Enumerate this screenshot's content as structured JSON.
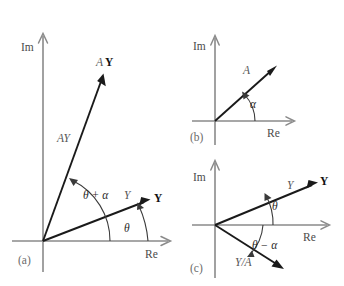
{
  "figure": {
    "background_color": "#ffffff",
    "axis_color": "#8a8a8a",
    "vector_color": "#1a1a1a",
    "arc_color": "#3a3a3a",
    "width": 344,
    "height": 286
  },
  "panels": [
    {
      "id": "a",
      "caption": "(a)",
      "axis_labels": {
        "imaginary": "Im",
        "real": "Re"
      },
      "vectors": [
        {
          "name": "AY-bold",
          "label": "AY",
          "style": "bold"
        },
        {
          "name": "AY-italic",
          "label": "AY",
          "style": "italic"
        },
        {
          "name": "Y-bold",
          "label": "Y",
          "style": "bold"
        },
        {
          "name": "Y-italic",
          "label": "Y",
          "style": "italic"
        }
      ],
      "angles": [
        {
          "name": "theta-plus-alpha",
          "label": "θ + α"
        },
        {
          "name": "theta",
          "label": "θ"
        }
      ]
    },
    {
      "id": "b",
      "caption": "(b)",
      "axis_labels": {
        "imaginary": "Im",
        "real": "Re"
      },
      "vectors": [
        {
          "name": "A-italic",
          "label": "A",
          "style": "italic"
        }
      ],
      "angles": [
        {
          "name": "alpha",
          "label": "α"
        }
      ]
    },
    {
      "id": "c",
      "caption": "(c)",
      "axis_labels": {
        "imaginary": "Im",
        "real": "Re"
      },
      "vectors": [
        {
          "name": "Y-bold",
          "label": "Y",
          "style": "bold"
        },
        {
          "name": "Y-italic",
          "label": "Y",
          "style": "italic"
        },
        {
          "name": "Y-over-A",
          "label": "Y/A",
          "style": "italic"
        }
      ],
      "angles": [
        {
          "name": "theta",
          "label": "θ"
        },
        {
          "name": "theta-minus-alpha",
          "label": "θ − α"
        }
      ]
    }
  ],
  "labels": {
    "im_a": "Im",
    "re_a": "Re",
    "panel_a": "(a)",
    "a_AY_bold": "A",
    "a_AY_boldY": "Y",
    "a_AY_italic": "AY",
    "a_Y_bold": "Y",
    "a_Y_italic": "Y",
    "a_theta_alpha": "θ + α",
    "a_theta": "θ",
    "im_b": "Im",
    "re_b": "Re",
    "panel_b": "(b)",
    "b_A": "A",
    "b_alpha": "α",
    "im_c": "Im",
    "re_c": "Re",
    "panel_c": "(c)",
    "c_Y_bold": "Y",
    "c_Y_italic": "Y",
    "c_Y_over_A": "Y/A",
    "c_theta": "θ",
    "c_theta_minus_alpha": "θ − α"
  }
}
